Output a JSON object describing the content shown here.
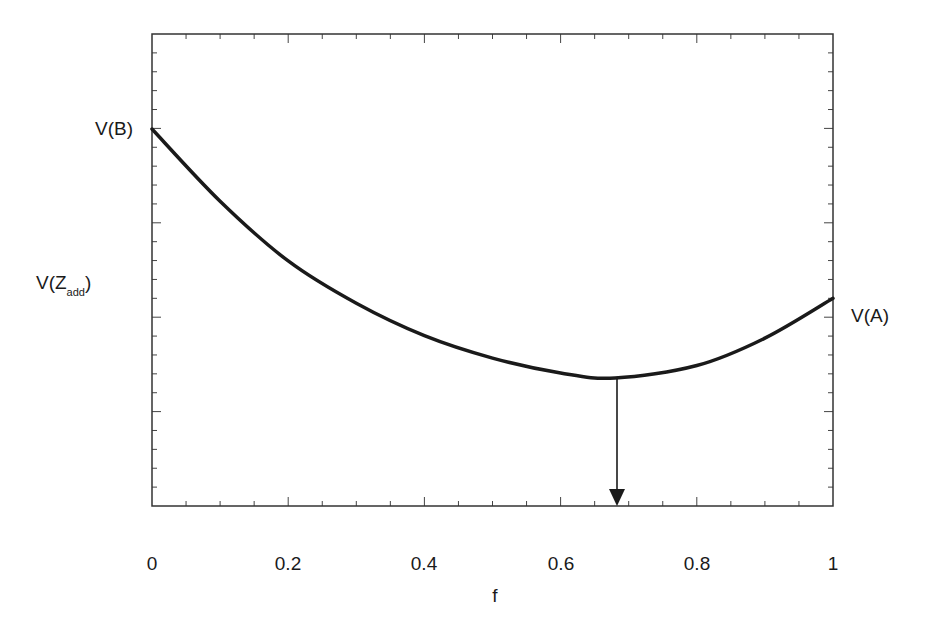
{
  "chart_data": {
    "type": "line",
    "title": "",
    "xlabel": "f",
    "ylabel": "",
    "xlim": [
      0,
      1
    ],
    "x_ticks": [
      "0",
      "0.2",
      "0.4",
      "0.6",
      "0.8",
      "1"
    ],
    "y_tick_labels": "none (unlabeled minor ticks only)",
    "grid": false,
    "legend": "none",
    "series": [
      {
        "name": "V(f)",
        "x": [
          0,
          0.1,
          0.2,
          0.3,
          0.4,
          0.5,
          0.6,
          0.68,
          0.8,
          0.9,
          1.0
        ],
        "y_relative": [
          1.0,
          0.71,
          0.47,
          0.3,
          0.17,
          0.08,
          0.02,
          0.0,
          0.05,
          0.16,
          0.32
        ],
        "note": "y normalized: V(B)=1.0 at f=0, minimum=0.0 at f≈0.68, V(A)≈0.32 at f=1"
      }
    ],
    "annotations": [
      {
        "text": "V(B)",
        "position": "left axis at f=0, curve start"
      },
      {
        "text": "V(A)",
        "position": "right axis at f=1, curve end"
      },
      {
        "text": "V(Z_add)",
        "position": "left of y-axis, middle height"
      },
      {
        "text": "arrow",
        "position": "vertical arrow from curve minimum (f≈0.68) down to x-axis"
      }
    ]
  },
  "labels": {
    "v_b": "V(B)",
    "v_a": "V(A)",
    "v_z_main": "V(Z",
    "v_z_sub": "add",
    "v_z_close": ")",
    "x_axis": "f"
  },
  "colors": {
    "line": "#1a1a1a",
    "frame": "#333333"
  }
}
